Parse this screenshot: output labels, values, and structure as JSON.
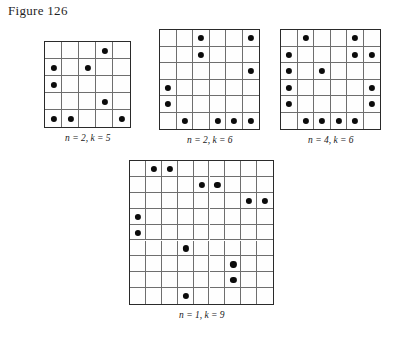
{
  "figure": {
    "label": "Figure 126"
  },
  "panels": [
    {
      "id": "panel-1",
      "caption": "n = 2, k = 5",
      "n": 2,
      "k": 5,
      "rows": 5,
      "cols": 5,
      "cell": 17,
      "x": 44,
      "y": 41,
      "dot_radius": 3.1,
      "dots": [
        {
          "row": 0,
          "col": 3
        },
        {
          "row": 1,
          "col": 0
        },
        {
          "row": 1,
          "col": 2
        },
        {
          "row": 2,
          "col": 0
        },
        {
          "row": 3,
          "col": 3
        },
        {
          "row": 4,
          "col": 0
        },
        {
          "row": 4,
          "col": 1
        },
        {
          "row": 4,
          "col": 4
        }
      ]
    },
    {
      "id": "panel-2",
      "caption": "n = 2, k = 6",
      "n": 2,
      "k": 6,
      "rows": 6,
      "cols": 6,
      "cell": 16.5,
      "x": 159,
      "y": 29,
      "dot_radius": 3.1,
      "dots": [
        {
          "row": 0,
          "col": 2
        },
        {
          "row": 0,
          "col": 5
        },
        {
          "row": 1,
          "col": 2
        },
        {
          "row": 2,
          "col": 5
        },
        {
          "row": 3,
          "col": 0
        },
        {
          "row": 4,
          "col": 0
        },
        {
          "row": 5,
          "col": 1
        },
        {
          "row": 5,
          "col": 3
        },
        {
          "row": 5,
          "col": 4
        },
        {
          "row": 5,
          "col": 5
        }
      ]
    },
    {
      "id": "panel-3",
      "caption": "n = 4, k = 6",
      "n": 4,
      "k": 6,
      "rows": 6,
      "cols": 6,
      "cell": 16.5,
      "x": 280,
      "y": 29,
      "dot_radius": 3.1,
      "dots": [
        {
          "row": 0,
          "col": 1
        },
        {
          "row": 0,
          "col": 4
        },
        {
          "row": 1,
          "col": 0
        },
        {
          "row": 1,
          "col": 4
        },
        {
          "row": 1,
          "col": 5
        },
        {
          "row": 2,
          "col": 0
        },
        {
          "row": 2,
          "col": 2
        },
        {
          "row": 3,
          "col": 0
        },
        {
          "row": 3,
          "col": 5
        },
        {
          "row": 4,
          "col": 0
        },
        {
          "row": 4,
          "col": 5
        },
        {
          "row": 5,
          "col": 1
        },
        {
          "row": 5,
          "col": 2
        },
        {
          "row": 5,
          "col": 3
        },
        {
          "row": 5,
          "col": 4
        }
      ]
    },
    {
      "id": "panel-4",
      "caption": "n = 1, k = 9",
      "n": 1,
      "k": 9,
      "rows": 9,
      "cols": 9,
      "cell": 15.9,
      "x": 129,
      "y": 160,
      "dot_radius": 3.1,
      "dots": [
        {
          "row": 0,
          "col": 1
        },
        {
          "row": 0,
          "col": 2
        },
        {
          "row": 1,
          "col": 4
        },
        {
          "row": 1,
          "col": 5
        },
        {
          "row": 2,
          "col": 7
        },
        {
          "row": 2,
          "col": 8
        },
        {
          "row": 3,
          "col": 0
        },
        {
          "row": 4,
          "col": 0
        },
        {
          "row": 5,
          "col": 3
        },
        {
          "row": 6,
          "col": 6
        },
        {
          "row": 7,
          "col": 6
        },
        {
          "row": 8,
          "col": 3
        }
      ]
    }
  ],
  "colors": {
    "dot": "#0b0b0b",
    "grid_outer": "#2a2a2a",
    "grid_inner": "#6e6e6e",
    "background": "#ffffff"
  }
}
